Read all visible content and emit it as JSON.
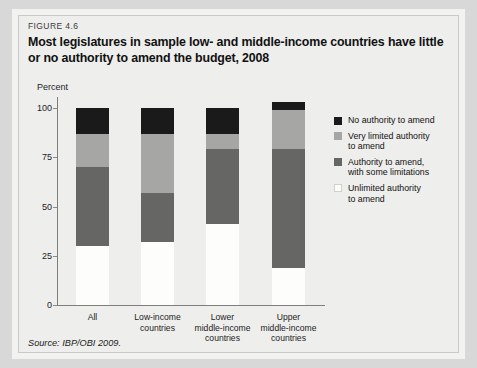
{
  "figure": {
    "number": "FIGURE 4.6",
    "title": "Most legislatures in sample low- and middle-income countries have little or no authority to amend the budget, 2008",
    "source": "Source: IBP/OBI 2009."
  },
  "chart_data": {
    "type": "bar",
    "stacked": true,
    "title": "Most legislatures in sample low- and middle-income countries have little or no authority to amend the budget, 2008",
    "xlabel": "",
    "ylabel": "Percent",
    "ylim": [
      0,
      100
    ],
    "yticks": [
      0,
      25,
      50,
      75,
      100
    ],
    "ytick_labels": [
      "0",
      "25",
      "50",
      "75",
      "100"
    ],
    "grid": false,
    "legend_position": "right",
    "categories": [
      "All",
      "Low-income countries",
      "Lower middle-income countries",
      "Upper middle-income countries"
    ],
    "category_lines": [
      [
        "All"
      ],
      [
        "Low-income",
        "countries"
      ],
      [
        "Lower",
        "middle-income",
        "countries"
      ],
      [
        "Upper",
        "middle-income",
        "countries"
      ]
    ],
    "series": [
      {
        "name": "Unlimited authority to amend",
        "color": "#fdfdfc",
        "values": [
          30,
          32,
          41,
          19
        ]
      },
      {
        "name": "Authority to amend, with some limitations",
        "color": "#666664",
        "values": [
          40,
          25,
          38,
          60
        ]
      },
      {
        "name": "Very limited authority to amend",
        "color": "#a6a6a4",
        "values": [
          17,
          30,
          8,
          20
        ]
      },
      {
        "name": "No authority to amend",
        "color": "#1a1a1a",
        "values": [
          13,
          13,
          13,
          4
        ]
      }
    ],
    "legend": [
      {
        "label_lines": [
          "No authority to amend"
        ],
        "color": "#1a1a1a"
      },
      {
        "label_lines": [
          "Very limited authority",
          "to amend"
        ],
        "color": "#a6a6a4"
      },
      {
        "label_lines": [
          "Authority to amend,",
          "with some limitations"
        ],
        "color": "#666664"
      },
      {
        "label_lines": [
          "Unlimited authority",
          "to amend"
        ],
        "color": "#fdfdfc"
      }
    ]
  }
}
